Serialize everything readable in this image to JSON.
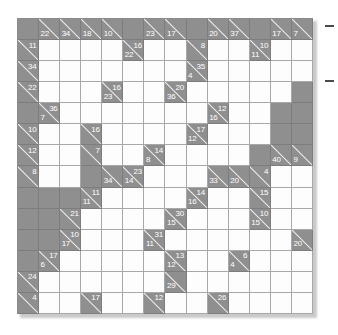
{
  "puzzle": {
    "type": "kakuro",
    "title": "Kakuro Puzzle Grid",
    "columns": 14,
    "rows": 14,
    "cell_size_px": 21.07,
    "colors": {
      "block": "#8f8f8f",
      "white": "#fdfdfd",
      "grid_line": "#a8a8a8",
      "clue_text": "#ffffff",
      "slash": "#efefef",
      "page_background": "#ffffff"
    },
    "legend": {
      "white_cell": "empty entry cell",
      "block_cell": "solid blocker",
      "clue_cell": "split clue cell with diagonal: upper-right number is the ACROSS sum, lower-left number is the DOWN sum"
    },
    "cells": [
      [
        {
          "t": "block"
        },
        {
          "t": "clue",
          "down": "22"
        },
        {
          "t": "clue",
          "down": "34"
        },
        {
          "t": "clue",
          "down": "18"
        },
        {
          "t": "clue",
          "down": "10"
        },
        {
          "t": "block"
        },
        {
          "t": "clue",
          "down": "23"
        },
        {
          "t": "clue",
          "down": "17"
        },
        {
          "t": "block"
        },
        {
          "t": "clue",
          "down": "20"
        },
        {
          "t": "clue",
          "down": "37"
        },
        {
          "t": "block"
        },
        {
          "t": "clue",
          "down": "17"
        },
        {
          "t": "clue",
          "down": "7"
        }
      ],
      [
        {
          "t": "clue",
          "across": "11"
        },
        {
          "t": "white"
        },
        {
          "t": "white"
        },
        {
          "t": "white"
        },
        {
          "t": "white"
        },
        {
          "t": "clue",
          "across": "16",
          "down": "22"
        },
        {
          "t": "white"
        },
        {
          "t": "white"
        },
        {
          "t": "clue",
          "across": "8"
        },
        {
          "t": "white"
        },
        {
          "t": "white"
        },
        {
          "t": "clue",
          "across": "10",
          "down": "11"
        },
        {
          "t": "white"
        },
        {
          "t": "white"
        }
      ],
      [
        {
          "t": "clue",
          "across": "34"
        },
        {
          "t": "white"
        },
        {
          "t": "white"
        },
        {
          "t": "white"
        },
        {
          "t": "white"
        },
        {
          "t": "white"
        },
        {
          "t": "white"
        },
        {
          "t": "white"
        },
        {
          "t": "clue",
          "across": "35",
          "down": "4"
        },
        {
          "t": "white"
        },
        {
          "t": "white"
        },
        {
          "t": "white"
        },
        {
          "t": "white"
        },
        {
          "t": "white"
        }
      ],
      [
        {
          "t": "clue",
          "across": "22"
        },
        {
          "t": "white"
        },
        {
          "t": "white"
        },
        {
          "t": "white"
        },
        {
          "t": "clue",
          "across": "16",
          "down": "23"
        },
        {
          "t": "white"
        },
        {
          "t": "white"
        },
        {
          "t": "clue",
          "across": "20",
          "down": "36"
        },
        {
          "t": "white"
        },
        {
          "t": "white"
        },
        {
          "t": "white"
        },
        {
          "t": "white"
        },
        {
          "t": "white"
        },
        {
          "t": "block"
        }
      ],
      [
        {
          "t": "block"
        },
        {
          "t": "clue",
          "across": "36",
          "down": "7"
        },
        {
          "t": "white"
        },
        {
          "t": "white"
        },
        {
          "t": "white"
        },
        {
          "t": "white"
        },
        {
          "t": "white"
        },
        {
          "t": "white"
        },
        {
          "t": "white"
        },
        {
          "t": "clue",
          "across": "12",
          "down": "16"
        },
        {
          "t": "white"
        },
        {
          "t": "white"
        },
        {
          "t": "block"
        },
        {
          "t": "block"
        }
      ],
      [
        {
          "t": "clue",
          "across": "10"
        },
        {
          "t": "white"
        },
        {
          "t": "white"
        },
        {
          "t": "clue",
          "across": "16"
        },
        {
          "t": "white"
        },
        {
          "t": "white"
        },
        {
          "t": "white"
        },
        {
          "t": "white"
        },
        {
          "t": "clue",
          "across": "17",
          "down": "12"
        },
        {
          "t": "white"
        },
        {
          "t": "white"
        },
        {
          "t": "white"
        },
        {
          "t": "block"
        },
        {
          "t": "block"
        }
      ],
      [
        {
          "t": "clue",
          "across": "12"
        },
        {
          "t": "white"
        },
        {
          "t": "white"
        },
        {
          "t": "clue",
          "across": "7"
        },
        {
          "t": "white"
        },
        {
          "t": "white"
        },
        {
          "t": "clue",
          "across": "14",
          "down": "8"
        },
        {
          "t": "white"
        },
        {
          "t": "white"
        },
        {
          "t": "white"
        },
        {
          "t": "white"
        },
        {
          "t": "block"
        },
        {
          "t": "clue",
          "down": "40"
        },
        {
          "t": "clue",
          "down": "9"
        }
      ],
      [
        {
          "t": "clue",
          "across": "8"
        },
        {
          "t": "white"
        },
        {
          "t": "white"
        },
        {
          "t": "block"
        },
        {
          "t": "clue",
          "down": "34"
        },
        {
          "t": "clue",
          "across": "23",
          "down": "14"
        },
        {
          "t": "white"
        },
        {
          "t": "white"
        },
        {
          "t": "white"
        },
        {
          "t": "clue",
          "down": "33"
        },
        {
          "t": "clue",
          "down": "20"
        },
        {
          "t": "clue",
          "across": "4"
        },
        {
          "t": "white"
        },
        {
          "t": "white"
        }
      ],
      [
        {
          "t": "block"
        },
        {
          "t": "block"
        },
        {
          "t": "block"
        },
        {
          "t": "clue",
          "across": "11",
          "down": "11"
        },
        {
          "t": "white"
        },
        {
          "t": "white"
        },
        {
          "t": "white"
        },
        {
          "t": "white"
        },
        {
          "t": "clue",
          "across": "14",
          "down": "16"
        },
        {
          "t": "white"
        },
        {
          "t": "white"
        },
        {
          "t": "clue",
          "across": "15"
        },
        {
          "t": "white"
        },
        {
          "t": "white"
        }
      ],
      [
        {
          "t": "block"
        },
        {
          "t": "block"
        },
        {
          "t": "clue",
          "across": "21"
        },
        {
          "t": "white"
        },
        {
          "t": "white"
        },
        {
          "t": "white"
        },
        {
          "t": "white"
        },
        {
          "t": "clue",
          "across": "30",
          "down": "15"
        },
        {
          "t": "white"
        },
        {
          "t": "white"
        },
        {
          "t": "white"
        },
        {
          "t": "clue",
          "across": "10",
          "down": "15"
        },
        {
          "t": "white"
        },
        {
          "t": "white"
        }
      ],
      [
        {
          "t": "block"
        },
        {
          "t": "block"
        },
        {
          "t": "clue",
          "across": "10",
          "down": "17"
        },
        {
          "t": "white"
        },
        {
          "t": "white"
        },
        {
          "t": "white"
        },
        {
          "t": "clue",
          "across": "31",
          "down": "11"
        },
        {
          "t": "white"
        },
        {
          "t": "white"
        },
        {
          "t": "white"
        },
        {
          "t": "white"
        },
        {
          "t": "white"
        },
        {
          "t": "white"
        },
        {
          "t": "clue",
          "down": "20"
        }
      ],
      [
        {
          "t": "block"
        },
        {
          "t": "clue",
          "across": "17",
          "down": "6"
        },
        {
          "t": "white"
        },
        {
          "t": "white"
        },
        {
          "t": "white"
        },
        {
          "t": "white"
        },
        {
          "t": "white"
        },
        {
          "t": "clue",
          "across": "13",
          "down": "12"
        },
        {
          "t": "white"
        },
        {
          "t": "white"
        },
        {
          "t": "clue",
          "across": "6",
          "down": "4"
        },
        {
          "t": "white"
        },
        {
          "t": "white"
        },
        {
          "t": "white"
        }
      ],
      [
        {
          "t": "clue",
          "across": "24"
        },
        {
          "t": "white"
        },
        {
          "t": "white"
        },
        {
          "t": "white"
        },
        {
          "t": "white"
        },
        {
          "t": "white"
        },
        {
          "t": "white"
        },
        {
          "t": "clue",
          "down": "29"
        },
        {
          "t": "white"
        },
        {
          "t": "white"
        },
        {
          "t": "white"
        },
        {
          "t": "white"
        },
        {
          "t": "white"
        },
        {
          "t": "white"
        }
      ],
      [
        {
          "t": "clue",
          "across": "4"
        },
        {
          "t": "white"
        },
        {
          "t": "white"
        },
        {
          "t": "clue",
          "across": "17"
        },
        {
          "t": "white"
        },
        {
          "t": "white"
        },
        {
          "t": "clue",
          "across": "12"
        },
        {
          "t": "white"
        },
        {
          "t": "white"
        },
        {
          "t": "clue",
          "across": "26"
        },
        {
          "t": "white"
        },
        {
          "t": "white"
        },
        {
          "t": "white"
        },
        {
          "t": "white"
        }
      ]
    ]
  }
}
